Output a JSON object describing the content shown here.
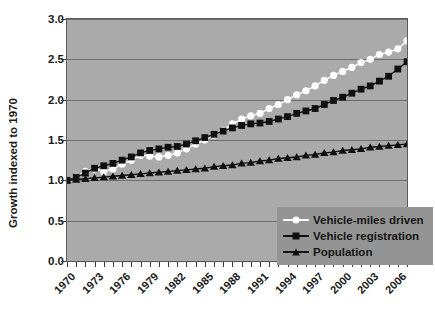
{
  "chart_data": {
    "type": "line",
    "title": "",
    "xlabel": "",
    "ylabel": "Growth indexed to 1970",
    "xlim": [
      1970,
      2007
    ],
    "ylim": [
      0.0,
      3.0
    ],
    "grid": true,
    "legend_position": "bottom-right",
    "y_ticks": [
      "0.0",
      "0.5",
      "1.0",
      "1.5",
      "2.0",
      "2.5",
      "3.0"
    ],
    "y_tick_values": [
      0.0,
      0.5,
      1.0,
      1.5,
      2.0,
      2.5,
      3.0
    ],
    "x_tick_labels": [
      "1970",
      "1973",
      "1976",
      "1979",
      "1982",
      "1985",
      "1988",
      "1991",
      "1994",
      "1997",
      "2000",
      "2003",
      "2006"
    ],
    "x_tick_values": [
      1970,
      1973,
      1976,
      1979,
      1982,
      1985,
      1988,
      1991,
      1994,
      1997,
      2000,
      2003,
      2006
    ],
    "x": [
      1970,
      1971,
      1972,
      1973,
      1974,
      1975,
      1976,
      1977,
      1978,
      1979,
      1980,
      1981,
      1982,
      1983,
      1984,
      1985,
      1986,
      1987,
      1988,
      1989,
      1990,
      1991,
      1992,
      1993,
      1994,
      1995,
      1996,
      1997,
      1998,
      1999,
      2000,
      2001,
      2002,
      2003,
      2004,
      2005,
      2006,
      2007
    ],
    "series": [
      {
        "name": "Vehicle-miles driven",
        "marker": "circle",
        "marker_color": "#ffffff",
        "line_color": "#ffffff",
        "values": [
          1.0,
          1.05,
          1.11,
          1.14,
          1.11,
          1.14,
          1.2,
          1.25,
          1.31,
          1.3,
          1.29,
          1.31,
          1.34,
          1.39,
          1.45,
          1.5,
          1.56,
          1.62,
          1.7,
          1.76,
          1.8,
          1.83,
          1.89,
          1.94,
          2.0,
          2.06,
          2.11,
          2.17,
          2.24,
          2.3,
          2.35,
          2.4,
          2.46,
          2.5,
          2.56,
          2.59,
          2.63,
          2.73
        ]
      },
      {
        "name": "Vehicle registration",
        "marker": "square",
        "marker_color": "#101010",
        "line_color": "#101010",
        "values": [
          1.0,
          1.04,
          1.09,
          1.15,
          1.18,
          1.21,
          1.25,
          1.29,
          1.34,
          1.37,
          1.39,
          1.41,
          1.42,
          1.45,
          1.49,
          1.53,
          1.57,
          1.61,
          1.65,
          1.68,
          1.7,
          1.71,
          1.73,
          1.76,
          1.79,
          1.83,
          1.86,
          1.89,
          1.94,
          1.99,
          2.03,
          2.08,
          2.13,
          2.17,
          2.23,
          2.29,
          2.38,
          2.47
        ]
      },
      {
        "name": "Population",
        "marker": "triangle",
        "marker_color": "#101010",
        "line_color": "#101010",
        "values": [
          1.0,
          1.01,
          1.02,
          1.03,
          1.04,
          1.05,
          1.06,
          1.07,
          1.08,
          1.09,
          1.1,
          1.11,
          1.12,
          1.13,
          1.14,
          1.15,
          1.17,
          1.18,
          1.19,
          1.21,
          1.22,
          1.24,
          1.25,
          1.27,
          1.28,
          1.29,
          1.31,
          1.32,
          1.34,
          1.35,
          1.37,
          1.38,
          1.39,
          1.41,
          1.42,
          1.43,
          1.44,
          1.45
        ]
      }
    ]
  },
  "colors": {
    "plot_background": "#aaaaaa",
    "legend_background": "#949494",
    "gridline": "#6e6e6e",
    "axis": "#5a5a5a",
    "text": "#1a1a1a"
  }
}
